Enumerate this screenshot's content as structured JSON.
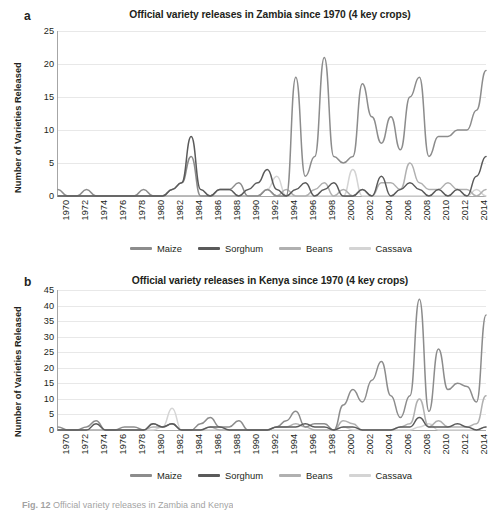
{
  "figure": {
    "caption_prefix": "Fig. 12",
    "caption_text": "Official variety releases in Zambia and Kenya"
  },
  "panels": [
    {
      "letter": "a",
      "title": "Official variety releases in Zambia since 1970 (4 key crops)",
      "ylabel": "Number of Varieties Released",
      "legend": [
        {
          "label": "Maize",
          "color": "#8c8c8c"
        },
        {
          "label": "Sorghum",
          "color": "#5a5a5a"
        },
        {
          "label": "Beans",
          "color": "#b0b0b0"
        },
        {
          "label": "Cassava",
          "color": "#d4d4d4"
        }
      ]
    },
    {
      "letter": "b",
      "title": "Official variety releases in Kenya since 1970 (4 key crops)",
      "ylabel": "Number of Varieties Released",
      "legend": [
        {
          "label": "Maize",
          "color": "#8c8c8c"
        },
        {
          "label": "Sorghum",
          "color": "#5a5a5a"
        },
        {
          "label": "Beans",
          "color": "#b0b0b0"
        },
        {
          "label": "Cassava",
          "color": "#d4d4d4"
        }
      ]
    }
  ],
  "chart_data": [
    {
      "type": "line",
      "panel": "a",
      "title": "Official variety releases in Zambia since 1970 (4 key crops)",
      "xlabel": "",
      "ylabel": "Number of Varieties Released",
      "ylim": [
        0,
        25
      ],
      "yticks": [
        0,
        5,
        10,
        15,
        20,
        25
      ],
      "grid": true,
      "legend_position": "bottom",
      "x": [
        1970,
        1971,
        1972,
        1973,
        1974,
        1975,
        1976,
        1977,
        1978,
        1979,
        1980,
        1981,
        1982,
        1983,
        1984,
        1985,
        1986,
        1987,
        1988,
        1989,
        1990,
        1991,
        1992,
        1993,
        1994,
        1995,
        1996,
        1997,
        1998,
        1999,
        2000,
        2001,
        2002,
        2003,
        2004,
        2005,
        2006,
        2007,
        2008,
        2009,
        2010,
        2011,
        2012,
        2013,
        2014,
        2015
      ],
      "xtick_labels": [
        "1970",
        "1972",
        "1974",
        "1976",
        "1978",
        "1980",
        "1982",
        "1984",
        "1986",
        "1988",
        "1990",
        "1992",
        "1994",
        "1996",
        "1998",
        "2000",
        "2002",
        "2004",
        "2006",
        "2008",
        "2010",
        "2012",
        "2014"
      ],
      "series": [
        {
          "name": "Maize",
          "color": "#8c8c8c",
          "values": [
            1,
            0,
            0,
            1,
            0,
            0,
            0,
            0,
            0,
            1,
            0,
            0,
            1,
            2,
            6,
            0,
            0,
            1,
            1,
            2,
            0,
            0,
            1,
            0,
            0,
            18,
            3,
            6,
            21,
            6,
            5,
            6,
            17,
            12,
            8,
            12,
            7,
            15,
            18,
            6,
            9,
            9,
            10,
            10,
            13,
            19
          ]
        },
        {
          "name": "Sorghum",
          "color": "#5a5a5a",
          "values": [
            0,
            0,
            0,
            0,
            0,
            0,
            0,
            0,
            0,
            0,
            0,
            0,
            1,
            2,
            9,
            1,
            0,
            1,
            1,
            0,
            1,
            2,
            4,
            1,
            0,
            1,
            2,
            0,
            1,
            2,
            0,
            0,
            1,
            0,
            3,
            0,
            1,
            2,
            1,
            0,
            1,
            0,
            1,
            0,
            3,
            6
          ]
        },
        {
          "name": "Beans",
          "color": "#b0b0b0",
          "values": [
            0,
            0,
            0,
            0,
            0,
            0,
            0,
            0,
            0,
            0,
            0,
            0,
            0,
            0,
            0,
            0,
            0,
            0,
            0,
            0,
            0,
            0,
            1,
            0,
            1,
            0,
            0,
            1,
            2,
            0,
            1,
            0,
            1,
            0,
            2,
            2,
            1,
            5,
            2,
            1,
            1,
            2,
            1,
            1,
            0,
            1
          ]
        },
        {
          "name": "Cassava",
          "color": "#d4d4d4",
          "values": [
            0,
            0,
            0,
            0,
            0,
            0,
            0,
            0,
            0,
            0,
            0,
            0,
            0,
            0,
            0,
            0,
            0,
            0,
            0,
            0,
            0,
            0,
            1,
            3,
            0,
            0,
            0,
            0,
            0,
            0,
            0,
            4,
            0,
            0,
            0,
            0,
            0,
            0,
            0,
            0,
            0,
            0,
            0,
            0,
            1,
            0
          ]
        }
      ]
    },
    {
      "type": "line",
      "panel": "b",
      "title": "Official variety releases in Kenya since 1970 (4 key crops)",
      "xlabel": "",
      "ylabel": "Number of Varieties Released",
      "ylim": [
        0,
        45
      ],
      "yticks": [
        0,
        5,
        10,
        15,
        20,
        25,
        30,
        35,
        40,
        45
      ],
      "grid": true,
      "legend_position": "bottom",
      "x": [
        1970,
        1971,
        1972,
        1973,
        1974,
        1975,
        1976,
        1977,
        1978,
        1979,
        1980,
        1981,
        1982,
        1983,
        1984,
        1985,
        1986,
        1987,
        1988,
        1989,
        1990,
        1991,
        1992,
        1993,
        1994,
        1995,
        1996,
        1997,
        1998,
        1999,
        2000,
        2001,
        2002,
        2003,
        2004,
        2005,
        2006,
        2007,
        2008,
        2009,
        2010,
        2011,
        2012,
        2013,
        2014,
        2015
      ],
      "xtick_labels": [
        "1970",
        "1972",
        "1974",
        "1976",
        "1978",
        "1980",
        "1982",
        "1984",
        "1986",
        "1988",
        "1990",
        "1992",
        "1994",
        "1996",
        "1998",
        "2000",
        "2002",
        "2004",
        "2006",
        "2008",
        "2010",
        "2012",
        "2014"
      ],
      "series": [
        {
          "name": "Maize",
          "color": "#8c8c8c",
          "values": [
            1,
            0,
            0,
            1,
            3,
            0,
            0,
            1,
            1,
            0,
            2,
            1,
            2,
            0,
            0,
            2,
            4,
            1,
            1,
            3,
            0,
            0,
            0,
            1,
            3,
            6,
            1,
            2,
            2,
            0,
            8,
            13,
            9,
            16,
            22,
            11,
            4,
            11,
            42,
            6,
            26,
            13,
            15,
            14,
            9,
            37
          ]
        },
        {
          "name": "Sorghum",
          "color": "#5a5a5a",
          "values": [
            0,
            0,
            0,
            0,
            2,
            0,
            0,
            0,
            0,
            0,
            2,
            1,
            2,
            0,
            0,
            0,
            1,
            1,
            0,
            0,
            0,
            0,
            0,
            1,
            1,
            1,
            2,
            1,
            1,
            0,
            1,
            1,
            0,
            0,
            0,
            0,
            1,
            1,
            4,
            1,
            1,
            1,
            2,
            1,
            0,
            1
          ]
        },
        {
          "name": "Beans",
          "color": "#b0b0b0",
          "values": [
            0,
            0,
            0,
            0,
            0,
            0,
            0,
            0,
            0,
            0,
            1,
            1,
            2,
            0,
            0,
            0,
            1,
            0,
            0,
            0,
            0,
            0,
            0,
            1,
            1,
            2,
            1,
            0,
            0,
            0,
            3,
            2,
            0,
            0,
            0,
            0,
            1,
            2,
            10,
            1,
            3,
            1,
            1,
            1,
            2,
            11
          ]
        },
        {
          "name": "Cassava",
          "color": "#d4d4d4",
          "values": [
            0,
            0,
            0,
            0,
            0,
            0,
            0,
            0,
            0,
            0,
            0,
            1,
            7,
            0,
            0,
            0,
            0,
            0,
            0,
            0,
            0,
            0,
            0,
            0,
            0,
            0,
            0,
            0,
            0,
            0,
            1,
            0,
            0,
            0,
            0,
            0,
            0,
            0,
            1,
            2,
            0,
            0,
            0,
            0,
            0,
            1
          ]
        }
      ]
    }
  ]
}
